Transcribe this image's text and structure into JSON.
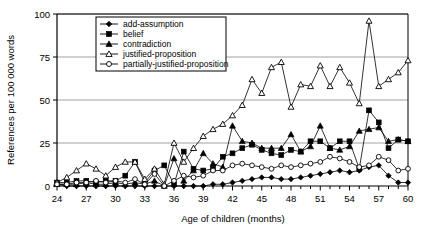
{
  "chart_data": {
    "type": "line",
    "title": "",
    "xlabel": "Age of children (months)",
    "ylabel": "References per 100 000 words",
    "xlim": [
      24,
      60
    ],
    "ylim": [
      0,
      100
    ],
    "yticks": [
      0,
      25,
      50,
      75,
      100
    ],
    "xticks_labeled": [
      24,
      27,
      30,
      33,
      36,
      39,
      42,
      45,
      48,
      51,
      54,
      57,
      60
    ],
    "x": [
      24,
      25,
      26,
      27,
      28,
      29,
      30,
      31,
      32,
      33,
      34,
      35,
      36,
      37,
      38,
      39,
      40,
      41,
      42,
      43,
      44,
      45,
      46,
      47,
      48,
      49,
      50,
      51,
      52,
      53,
      54,
      55,
      56,
      57,
      58,
      59,
      60
    ],
    "grid": "horizontal",
    "legend_position": "top-left-inside",
    "series": [
      {
        "name": "add-assumption",
        "marker": "filled-diamond",
        "values": [
          1,
          0,
          0,
          0,
          0,
          0,
          0,
          0,
          0,
          0,
          0,
          0,
          0,
          0,
          0,
          0,
          1,
          1,
          2,
          3,
          4,
          5,
          5,
          4,
          4,
          5,
          6,
          7,
          8,
          9,
          8,
          9,
          11,
          12,
          6,
          2,
          2
        ]
      },
      {
        "name": "belief",
        "marker": "filled-square",
        "values": [
          2,
          2,
          3,
          3,
          2,
          3,
          3,
          6,
          14,
          2,
          9,
          12,
          1,
          20,
          10,
          9,
          10,
          17,
          19,
          22,
          24,
          21,
          19,
          18,
          21,
          20,
          26,
          26,
          22,
          26,
          26,
          10,
          44,
          37,
          22,
          27,
          26
        ]
      },
      {
        "name": "contradiction",
        "marker": "filled-triangle",
        "values": [
          1,
          1,
          1,
          2,
          1,
          1,
          2,
          1,
          2,
          1,
          3,
          0,
          16,
          3,
          9,
          19,
          13,
          11,
          35,
          26,
          25,
          22,
          22,
          22,
          30,
          20,
          23,
          35,
          22,
          21,
          23,
          32,
          33,
          34,
          26,
          27,
          26
        ]
      },
      {
        "name": "justified-proposition",
        "marker": "open-triangle",
        "values": [
          2,
          5,
          9,
          13,
          10,
          6,
          11,
          14,
          14,
          4,
          10,
          1,
          25,
          14,
          22,
          29,
          33,
          36,
          41,
          47,
          62,
          54,
          69,
          72,
          46,
          59,
          58,
          70,
          58,
          69,
          60,
          48,
          96,
          58,
          62,
          66,
          73
        ]
      },
      {
        "name": "partially-justified-proposition",
        "marker": "open-circle",
        "values": [
          1,
          1,
          2,
          2,
          3,
          2,
          3,
          2,
          4,
          1,
          7,
          0,
          3,
          6,
          5,
          6,
          9,
          9,
          12,
          13,
          12,
          11,
          10,
          12,
          11,
          12,
          13,
          14,
          17,
          16,
          14,
          11,
          12,
          17,
          15,
          9,
          10
        ]
      }
    ]
  },
  "legend": {
    "items": [
      {
        "label": "add-assumption"
      },
      {
        "label": "belief"
      },
      {
        "label": "contradiction"
      },
      {
        "label": "justified-proposition"
      },
      {
        "label": "partially-justified-proposition"
      }
    ]
  }
}
